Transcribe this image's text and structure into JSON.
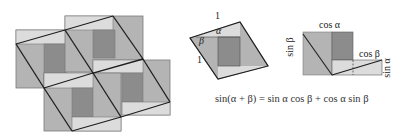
{
  "figure": {
    "colors": {
      "light": "#dcdcdc",
      "medium": "#b4b4b4",
      "dark": "#8c8c8c",
      "edge": "#7a7a7a",
      "line": "#1e1e1e"
    },
    "tiling": {
      "description": "Tiling of squares, each with light strip, medium region and dark inner square, overlaid by tilted parallelograms"
    },
    "diamond": {
      "labels": {
        "top_side": "1",
        "alpha": "α",
        "beta": "β",
        "left_side": "1"
      }
    },
    "rearranged": {
      "labels": {
        "cos_alpha": "cos α",
        "sin_beta": "sin β",
        "cos_beta": "cos β",
        "sin_alpha": "sin α"
      }
    },
    "formula": {
      "lhs": "sin(α + β)",
      "equals": "=",
      "term1": "sin α cos β",
      "plus": "+",
      "term2": "cos α sin β"
    }
  }
}
